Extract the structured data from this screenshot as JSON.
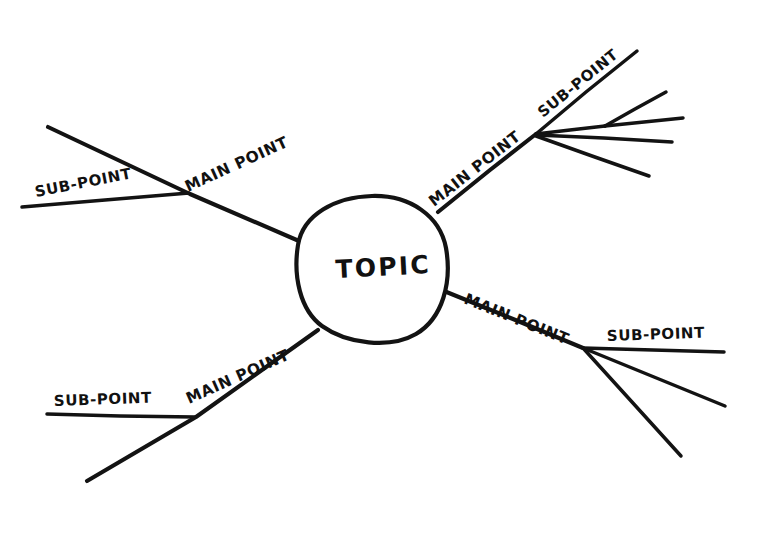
{
  "document": {
    "type": "hand-drawn mind map sketch",
    "background_color": "#ffffff",
    "ink_color": "#131313",
    "width": 761,
    "height": 534
  },
  "center": {
    "label": "TOPIC",
    "shape": "circle",
    "cx": 372,
    "cy": 268,
    "rx": 76,
    "ry": 72
  },
  "branches": [
    {
      "id": "upper-left",
      "main_label": "MAIN POINT",
      "main_label_rotation": -24.5,
      "sub_label": "SUB-POINT",
      "sub_label_rotation": -11,
      "sub_count": 1
    },
    {
      "id": "upper-right",
      "main_label": "MAIN POINT",
      "main_label_rotation": -38,
      "sub_label": "SUB-POINT",
      "sub_label_rotation": -39,
      "sub_count": 4
    },
    {
      "id": "lower-right",
      "main_label": "MAIN POINT",
      "main_label_rotation": 22,
      "sub_label": "SUB-POINT",
      "sub_label_rotation": -2,
      "sub_count": 3
    },
    {
      "id": "lower-left",
      "main_label": "MAIN POINT",
      "main_label_rotation": -24,
      "sub_label": "SUB-POINT",
      "sub_label_rotation": -2,
      "sub_count": 1
    }
  ],
  "geometry": {
    "circle_path": "M 372 196 C 410 195 440 216 446 248 C 452 282 443 318 416 334 C 390 349 347 344 322 326 C 300 310 293 276 298 245 C 303 214 336 197 372 196 Z",
    "upper_left_trunk": "M 299 241 L 190 194 L 48 127",
    "upper_left_sub": "M 189 193 L 105 200 L 22 207",
    "lower_left_trunk": "M 318 330 L 196 417 L 87 481",
    "lower_left_sub": "M 195 417 L 120 416 L 47 414",
    "upper_right_trunk": "M 438 212 L 490 170 L 536 134",
    "upper_right_sub_1": "M 536 134 L 586 92 L 637 51",
    "upper_right_sub_2": "M 536 134 L 570 130 L 605 126",
    "upper_right_sub_2a": "M 605 126 L 635 109 L 666 92",
    "upper_right_sub_2b": "M 605 126 L 644 122 L 683 118",
    "upper_right_sub_3": "M 536 135 L 604 138 L 672 142",
    "upper_right_sub_4": "M 536 136 L 592 156 L 649 176",
    "lower_right_trunk": "M 444 291 L 513 319 L 583 348",
    "lower_right_sub_1": "M 583 348 L 653 350 L 724 352",
    "lower_right_sub_2": "M 583 348 L 654 377 L 725 406",
    "lower_right_sub_3": "M 583 348 L 632 402 L 681 456",
    "label_positions": {
      "topic": {
        "x": 336,
        "y": 278
      },
      "main_upper_left": {
        "x": 188,
        "y": 192
      },
      "sub_upper_left": {
        "x": 36,
        "y": 197
      },
      "main_upper_right": {
        "x": 434,
        "y": 207
      },
      "sub_upper_right": {
        "x": 543,
        "y": 118
      },
      "main_lower_right": {
        "x": 463,
        "y": 303
      },
      "sub_lower_right": {
        "x": 607,
        "y": 341
      },
      "main_lower_left": {
        "x": 189,
        "y": 404
      },
      "sub_lower_left": {
        "x": 54,
        "y": 406
      }
    }
  }
}
